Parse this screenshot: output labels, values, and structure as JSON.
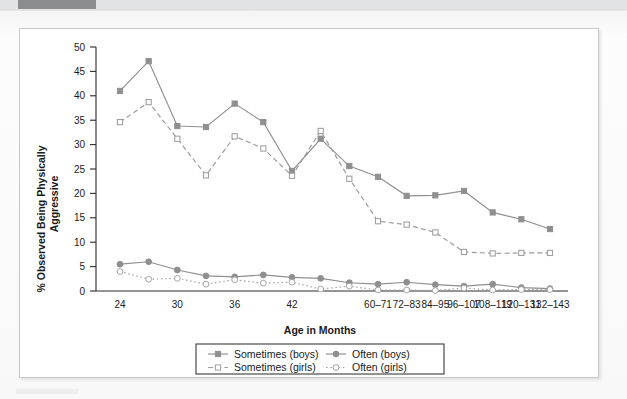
{
  "figure": {
    "background_color": "#ffffff",
    "border_color": "#c9c9c9"
  },
  "scan": {
    "top_band_color": "#e2e3e4",
    "top_band_dark_color": "#8b8d8f",
    "bottom_mark_color": "#eceded"
  },
  "chart_data": {
    "type": "line",
    "title": "",
    "subtitle": "",
    "xlabel": "Age in Months",
    "ylabel": "% Observed Being Physically Aggressive",
    "ylabel_line1": "% Observed Being Physically",
    "ylabel_line2": "Aggressive",
    "ylim": [
      0,
      50
    ],
    "yticks": [
      0,
      5,
      10,
      15,
      20,
      25,
      30,
      35,
      40,
      45,
      50
    ],
    "ytick_labels": [
      "0",
      "5",
      "10",
      "15",
      "20",
      "25",
      "30",
      "35",
      "40",
      "45",
      "50"
    ],
    "grid": false,
    "legend_position": "bottom",
    "categories": [
      "24",
      "",
      "30",
      "",
      "36",
      "",
      "42",
      "",
      "",
      "60-71",
      "72-83",
      "84-95",
      "96-107",
      "108-119",
      "120-131",
      "132-143"
    ],
    "xtick_labels": [
      "24",
      "30",
      "36",
      "42",
      "60–71",
      "72–83",
      "84–95",
      "96–107",
      "108–119",
      "120–131",
      "132–143"
    ],
    "x_positions": [
      0,
      1,
      2,
      3,
      4,
      5,
      6,
      7,
      8,
      9,
      10,
      11,
      12,
      13,
      14,
      15
    ],
    "series": [
      {
        "name": "Sometimes (boys)",
        "marker": "filled-square",
        "line_style": "solid",
        "color": "#8f8f8f",
        "values": [
          41.0,
          47.1,
          33.8,
          33.6,
          38.4,
          34.6,
          24.6,
          31.2,
          25.6,
          23.4,
          19.5,
          19.6,
          20.5,
          16.1,
          14.7,
          12.7
        ]
      },
      {
        "name": "Sometimes (girls)",
        "marker": "open-square",
        "line_style": "dashed",
        "color": "#9a9a9a",
        "values": [
          34.6,
          38.7,
          31.2,
          23.7,
          31.7,
          29.2,
          23.6,
          32.8,
          23.0,
          14.3,
          13.6,
          12.0,
          8.0,
          7.7,
          7.8,
          7.8
        ]
      },
      {
        "name": "Often (boys)",
        "marker": "filled-circle",
        "line_style": "solid",
        "color": "#8f8f8f",
        "values": [
          5.5,
          6.0,
          4.3,
          3.1,
          2.9,
          3.3,
          2.8,
          2.6,
          1.7,
          1.4,
          1.8,
          1.3,
          1.0,
          1.4,
          0.7,
          0.5
        ]
      },
      {
        "name": "Often (girls)",
        "marker": "open-circle",
        "line_style": "dotted",
        "color": "#a5a5a5",
        "values": [
          4.0,
          2.4,
          2.6,
          1.4,
          2.3,
          1.6,
          1.8,
          0.4,
          1.0,
          0.2,
          0.2,
          0.1,
          0.6,
          0.2,
          0.3,
          0.3
        ]
      }
    ]
  },
  "legend": {
    "items": [
      {
        "label": "Sometimes (boys)",
        "marker": "filled-square",
        "line_style": "solid"
      },
      {
        "label": "Often (boys)",
        "marker": "filled-circle",
        "line_style": "solid"
      },
      {
        "label": "Sometimes (girls)",
        "marker": "open-square",
        "line_style": "dashed"
      },
      {
        "label": "Often (girls)",
        "marker": "open-circle",
        "line_style": "dotted"
      }
    ]
  }
}
